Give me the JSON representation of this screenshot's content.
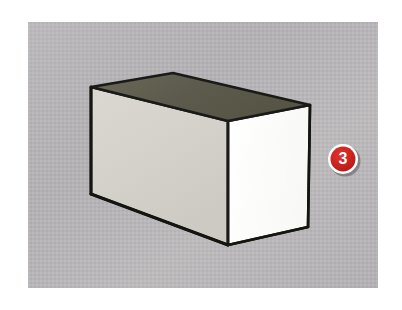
{
  "figure": {
    "type": "3d-box-line-drawing"
  },
  "canvas": {
    "page_background": "#ffffff",
    "panel": {
      "x": 28,
      "y": 22,
      "width": 350,
      "height": 266,
      "background": "#b6b3b6",
      "texture": "halftone-dither",
      "texture_colors": [
        "#bdbabd",
        "#aeabb0",
        "#c4c1c3"
      ]
    }
  },
  "box": {
    "name": "rectangular-box",
    "outline_color": "#1a1a18",
    "outline_width": 2.6,
    "faces": {
      "top": {
        "name": "box-top-face",
        "color": "#5e5c4e",
        "points": "91,87 173,73 310,105 228,121"
      },
      "front_left": {
        "name": "box-front-left-face",
        "color": "#d6d3cd",
        "points": "91,87 228,121 228,245 91,194"
      },
      "right": {
        "name": "box-right-face",
        "color": "#fdfdfb",
        "points": "228,121 310,105 308,227 228,245"
      }
    },
    "vertices": {
      "top_left": [
        91,
        87
      ],
      "top_back": [
        173,
        73
      ],
      "top_right": [
        310,
        105
      ],
      "top_front": [
        228,
        121
      ],
      "bottom_left": [
        91,
        194
      ],
      "bottom_front": [
        228,
        245
      ],
      "bottom_right": [
        308,
        227
      ]
    }
  },
  "callout": {
    "name": "callout-badge-3",
    "label": "3",
    "center_x": 343,
    "center_y": 159,
    "radius": 15,
    "fill_color": "#c8221f",
    "ring_color": "#ffffff",
    "ring_width": 2.5,
    "shadow_color": "rgba(60,60,60,0.45)",
    "text_color": "#ffffff"
  }
}
